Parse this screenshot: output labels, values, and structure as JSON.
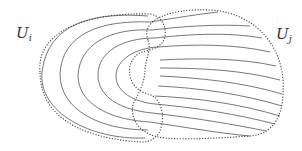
{
  "figure": {
    "type": "foliation-chart-overlap-diagram",
    "regions": [
      {
        "name": "U",
        "subscript": "i",
        "side": "left"
      },
      {
        "name": "U",
        "subscript": "j",
        "side": "right"
      }
    ],
    "left_leaf_count": 5,
    "right_leaf_count": 12,
    "colors": {
      "background": "#ffffff",
      "leaf_stroke": "#555555",
      "boundary_stroke": "#444444"
    }
  }
}
